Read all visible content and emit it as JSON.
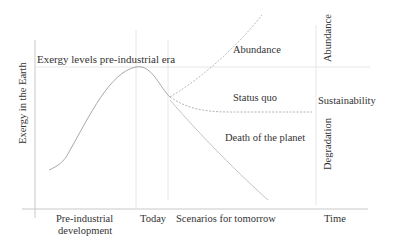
{
  "diagram": {
    "y_axis_label": "Exergy in the Earth",
    "reference_line_label": "Exergy levels pre-industrial era",
    "x_labels": {
      "pre_industrial_line1": "Pre-industrial",
      "pre_industrial_line2": "development",
      "today": "Today",
      "scenarios": "Scenarios for tomorrow",
      "time": "Time"
    },
    "scenarios": {
      "abundance": "Abundance",
      "status_quo": "Status quo",
      "death": "Death of the planet"
    },
    "outcomes": {
      "abundance": "Abundance",
      "sustainability": "Sustainability",
      "degradation": "Degradation"
    }
  }
}
